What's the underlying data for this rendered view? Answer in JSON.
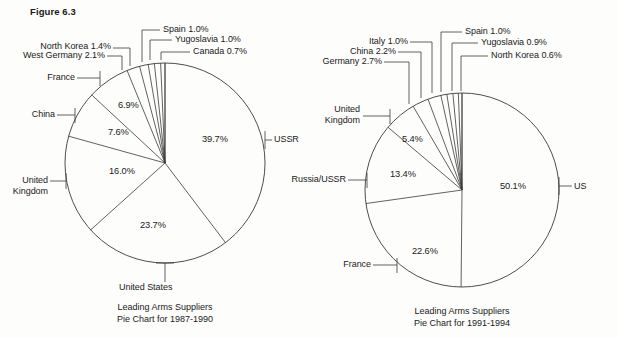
{
  "figure": {
    "label": "Figure 6.3"
  },
  "chart_data": [
    {
      "type": "pie",
      "id": "left",
      "title": "Leading Arms Suppliers",
      "subtitle": "Pie Chart for 1987-1990",
      "caption_line1": "Leading Arms Suppliers",
      "caption_line2": "Pie Chart for 1987-1990",
      "categories": [
        "USSR",
        "United States",
        "United Kingdom",
        "China",
        "France",
        "West Germany",
        "North Korea",
        "Spain",
        "Yugoslavia",
        "Canada"
      ],
      "values": [
        39.7,
        23.7,
        16.0,
        7.6,
        6.9,
        2.1,
        1.4,
        1.0,
        1.0,
        0.7
      ],
      "value_labels": [
        "39.7%",
        "23.7%",
        "16.0%",
        "7.6%",
        "6.9%",
        "2.1%",
        "1.4%",
        "1.0%",
        "1.0%",
        "0.7%"
      ],
      "inner_labels": [
        "39.7%",
        "23.7%",
        "16.0%",
        "7.6%",
        "6.9%"
      ],
      "outer_labels": [
        {
          "text": "USSR",
          "side": "right"
        },
        {
          "text": "United States",
          "side": "bottom"
        },
        {
          "text": "United Kingdom",
          "side": "left"
        },
        {
          "text": "China",
          "side": "left"
        },
        {
          "text": "France",
          "side": "left"
        },
        {
          "text": "West Germany 2.1%",
          "side": "top"
        },
        {
          "text": "North Korea 1.4%",
          "side": "top"
        },
        {
          "text": "Spain 1.0%",
          "side": "top"
        },
        {
          "text": "Yugoslavia 1.0%",
          "side": "top"
        },
        {
          "text": "Canada 0.7%",
          "side": "top"
        }
      ]
    },
    {
      "type": "pie",
      "id": "right",
      "title": "Leading Arms Suppliers",
      "subtitle": "Pie Chart for 1991-1994",
      "caption_line1": "Leading Arms Suppliers",
      "caption_line2": "Pie Chart for 1991-1994",
      "categories": [
        "US",
        "France",
        "Russia/USSR",
        "United Kingdom",
        "Germany",
        "China",
        "Italy",
        "Spain",
        "Yugoslavia",
        "North Korea"
      ],
      "values": [
        50.1,
        22.6,
        13.4,
        5.4,
        2.7,
        2.2,
        1.0,
        1.0,
        0.9,
        0.6
      ],
      "value_labels": [
        "50.1%",
        "22.6%",
        "13.4%",
        "5.4%",
        "2.7%",
        "2.2%",
        "1.0%",
        "1.0%",
        "0.9%",
        "0.6%"
      ],
      "inner_labels": [
        "50.1%",
        "22.6%",
        "13.4%",
        "5.4%"
      ],
      "outer_labels": [
        {
          "text": "US",
          "side": "right"
        },
        {
          "text": "France",
          "side": "left"
        },
        {
          "text": "Russia/USSR",
          "side": "left"
        },
        {
          "text": "United Kingdom",
          "side": "left"
        },
        {
          "text": "Germany 2.7%",
          "side": "top"
        },
        {
          "text": "China 2.2%",
          "side": "top"
        },
        {
          "text": "Italy 1.0%",
          "side": "top"
        },
        {
          "text": "Spain 1.0%",
          "side": "top"
        },
        {
          "text": "Yugoslavia 0.9%",
          "side": "top"
        },
        {
          "text": "North Korea 0.6%",
          "side": "top"
        }
      ]
    }
  ],
  "left_chart": {
    "pct_ussr": "39.7%",
    "pct_us": "23.7%",
    "pct_uk": "16.0%",
    "pct_china": "7.6%",
    "pct_france": "6.9%",
    "lbl_ussr": "USSR",
    "lbl_us": "United States",
    "lbl_uk_line1": "United",
    "lbl_uk_line2": "Kingdom",
    "lbl_china": "China",
    "lbl_france": "France",
    "lbl_westgermany": "West Germany 2.1%",
    "lbl_northkorea": "North Korea 1.4%",
    "lbl_spain": "Spain 1.0%",
    "lbl_yugoslavia": "Yugoslavia 1.0%",
    "lbl_canada": "Canada 0.7%",
    "caption1": "Leading Arms Suppliers",
    "caption2": "Pie Chart for 1987-1990"
  },
  "right_chart": {
    "pct_us": "50.1%",
    "pct_france": "22.6%",
    "pct_russia": "13.4%",
    "pct_uk": "5.4%",
    "lbl_us": "US",
    "lbl_france": "France",
    "lbl_russia": "Russia/USSR",
    "lbl_uk_line1": "United",
    "lbl_uk_line2": "Kingdom",
    "lbl_germany": "Germany 2.7%",
    "lbl_china": "China 2.2%",
    "lbl_italy": "Italy 1.0%",
    "lbl_spain": "Spain 1.0%",
    "lbl_yugoslavia": "Yugoslavia 0.9%",
    "lbl_northkorea": "North Korea 0.6%",
    "caption1": "Leading Arms Suppliers",
    "caption2": "Pie Chart for 1991-1994"
  },
  "colors": {
    "stroke": "#3a3a3a",
    "text": "#1a1a1a",
    "background": "#fdfdfc"
  }
}
